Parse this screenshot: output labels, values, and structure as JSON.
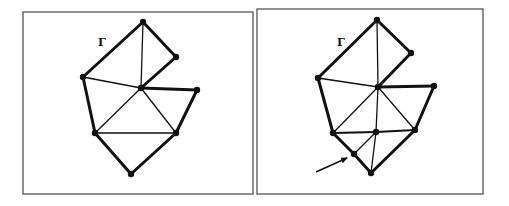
{
  "panels": [
    {
      "id": "left",
      "label": "Γ",
      "label_pos": [
        98,
        46
      ],
      "frame": [
        23,
        12,
        253,
        194
      ],
      "nodes": {
        "top": [
          143,
          22
        ],
        "rtop": [
          176,
          57
        ],
        "left": [
          83,
          77
        ],
        "center": [
          141,
          88
        ],
        "right": [
          197,
          90
        ],
        "ll": [
          95,
          133
        ],
        "lr": [
          176,
          133
        ],
        "bottom": [
          131,
          174
        ]
      },
      "thick_edges": [
        [
          "top",
          "left"
        ],
        [
          "top",
          "rtop"
        ],
        [
          "rtop",
          "center"
        ],
        [
          "center",
          "right"
        ],
        [
          "right",
          "lr"
        ],
        [
          "lr",
          "bottom"
        ],
        [
          "bottom",
          "ll"
        ],
        [
          "ll",
          "left"
        ]
      ],
      "thin_edges": [
        [
          "top",
          "center"
        ],
        [
          "left",
          "center"
        ],
        [
          "center",
          "ll"
        ],
        [
          "center",
          "lr"
        ],
        [
          "ll",
          "lr"
        ]
      ]
    },
    {
      "id": "right",
      "label": "Γ",
      "label_pos": [
        337,
        46
      ],
      "frame": [
        257,
        9,
        483,
        194
      ],
      "nodes": {
        "top": [
          377,
          20
        ],
        "rtop": [
          411,
          53
        ],
        "left": [
          318,
          78
        ],
        "center": [
          378,
          87
        ],
        "right": [
          434,
          86
        ],
        "ll": [
          333,
          133
        ],
        "mid": [
          376,
          132
        ],
        "lr": [
          415,
          130
        ],
        "new": [
          354,
          154
        ],
        "bottom": [
          371,
          173
        ]
      },
      "thick_edges": [
        [
          "top",
          "left"
        ],
        [
          "top",
          "rtop"
        ],
        [
          "rtop",
          "center"
        ],
        [
          "center",
          "right"
        ],
        [
          "right",
          "lr"
        ],
        [
          "lr",
          "bottom"
        ],
        [
          "bottom",
          "new"
        ],
        [
          "new",
          "ll"
        ],
        [
          "ll",
          "left"
        ]
      ],
      "thin_edges": [
        [
          "top",
          "center"
        ],
        [
          "left",
          "center"
        ],
        [
          "center",
          "ll"
        ],
        [
          "center",
          "lr"
        ],
        [
          "center",
          "mid"
        ],
        [
          "mid",
          "new"
        ],
        [
          "mid",
          "bottom"
        ]
      ],
      "mid_edges": [
        [
          "ll",
          "mid"
        ],
        [
          "mid",
          "lr"
        ]
      ],
      "arrow": {
        "from": [
          316,
          172
        ],
        "to": [
          347,
          158
        ],
        "target": "new"
      }
    }
  ]
}
